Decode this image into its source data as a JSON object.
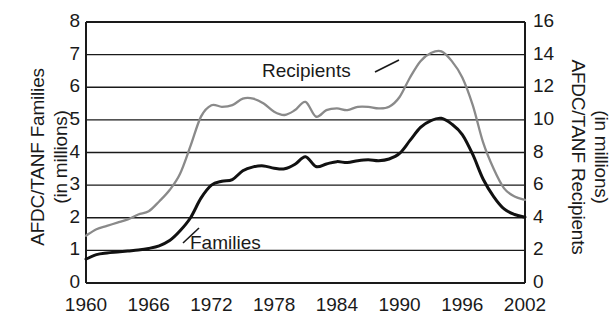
{
  "chart_data": {
    "type": "line",
    "title": "",
    "xlabel": "",
    "ylabel": "AFDC/TANF Families (in millions)",
    "ylabel_right": "AFDC/TANF Recipients (in millions)",
    "grid": true,
    "legend_position": "inline-annotations",
    "xlim": [
      1960,
      2002
    ],
    "ylim": [
      0,
      8
    ],
    "ylim_right": [
      0,
      16
    ],
    "xticks": [
      1960,
      1966,
      1972,
      1978,
      1984,
      1990,
      1996,
      2002
    ],
    "xtick_labels": [
      "1960",
      "1966",
      "1972",
      "1978",
      "1984",
      "1990",
      "1996",
      "2002"
    ],
    "yticks_left": [
      0,
      1,
      2,
      3,
      4,
      5,
      6,
      7,
      8
    ],
    "ytick_labels_left": [
      "0",
      "1",
      "2",
      "3",
      "4",
      "5",
      "6",
      "7",
      "8"
    ],
    "yticks_right": [
      0,
      2,
      4,
      6,
      8,
      10,
      12,
      14,
      16
    ],
    "ytick_labels_right": [
      "0",
      "2",
      "4",
      "6",
      "8",
      "10",
      "12",
      "14",
      "16"
    ],
    "series": [
      {
        "name": "Families",
        "axis": "left",
        "units": "millions",
        "color": "#111111",
        "annotation_label": "Families",
        "x": [
          1960,
          1961,
          1962,
          1963,
          1964,
          1965,
          1966,
          1967,
          1968,
          1969,
          1970,
          1971,
          1972,
          1973,
          1974,
          1975,
          1976,
          1977,
          1978,
          1979,
          1980,
          1981,
          1982,
          1983,
          1984,
          1985,
          1986,
          1987,
          1988,
          1989,
          1990,
          1991,
          1992,
          1993,
          1994,
          1995,
          1996,
          1997,
          1998,
          1999,
          2000,
          2001,
          2002
        ],
        "values": [
          0.73,
          0.87,
          0.92,
          0.95,
          0.98,
          1.01,
          1.06,
          1.14,
          1.3,
          1.6,
          2.0,
          2.6,
          3.0,
          3.12,
          3.17,
          3.44,
          3.56,
          3.59,
          3.52,
          3.5,
          3.64,
          3.87,
          3.57,
          3.65,
          3.72,
          3.69,
          3.75,
          3.78,
          3.75,
          3.8,
          3.97,
          4.37,
          4.77,
          4.98,
          5.05,
          4.87,
          4.55,
          3.94,
          3.18,
          2.65,
          2.27,
          2.1,
          2.02
        ]
      },
      {
        "name": "Recipients",
        "axis": "right",
        "units": "millions",
        "color": "#8a8a8a",
        "annotation_label": "Recipients",
        "x": [
          1960,
          1961,
          1962,
          1963,
          1964,
          1965,
          1966,
          1967,
          1968,
          1969,
          1970,
          1971,
          1972,
          1973,
          1974,
          1975,
          1976,
          1977,
          1978,
          1979,
          1980,
          1981,
          1982,
          1983,
          1984,
          1985,
          1986,
          1987,
          1988,
          1989,
          1990,
          1991,
          1992,
          1993,
          1994,
          1995,
          1996,
          1997,
          1998,
          1999,
          2000,
          2001,
          2002
        ],
        "values": [
          2.9,
          3.3,
          3.5,
          3.7,
          3.9,
          4.2,
          4.4,
          5.0,
          5.7,
          6.7,
          8.4,
          10.2,
          10.9,
          10.8,
          10.9,
          11.3,
          11.3,
          11.0,
          10.5,
          10.3,
          10.6,
          11.1,
          10.2,
          10.6,
          10.7,
          10.6,
          10.8,
          10.8,
          10.7,
          10.8,
          11.4,
          12.6,
          13.6,
          14.1,
          14.2,
          13.6,
          12.6,
          10.9,
          8.6,
          7.0,
          5.8,
          5.3,
          5.1
        ]
      }
    ]
  },
  "annotations": {
    "recipients": {
      "label": "Recipients",
      "leader_note": "line from label right edge up-right to gray curve"
    },
    "families": {
      "label": "Families",
      "leader_note": "line from label left edge up-left to black curve"
    }
  }
}
